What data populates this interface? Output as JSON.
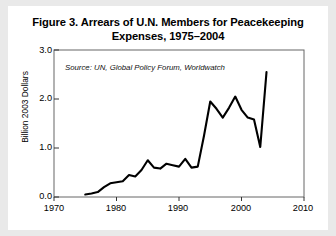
{
  "figure": {
    "title_line_1": "Figure 3. Arrears of U.N. Members for Peacekeeping",
    "title_line_2": "Expenses, 1975–2004",
    "source_note": "Source: UN, Global Policy Forum, Worldwatch",
    "background_color": "#e9e9e9",
    "card_color": "#ffffff",
    "line_color": "#000000",
    "axis_color": "#555555"
  },
  "chart_data": {
    "type": "line",
    "title": "Figure 3. Arrears of U.N. Members for Peacekeeping Expenses, 1975–2004",
    "xlabel": "",
    "ylabel": "Billion 2003 Dollars",
    "xlim": [
      1970,
      2010
    ],
    "ylim": [
      0.0,
      3.0
    ],
    "xticks": [
      1970,
      1980,
      1990,
      2000,
      2010
    ],
    "xtick_labels": [
      "1970",
      "1980",
      "1990",
      "2000",
      "2010"
    ],
    "yticks": [
      0.0,
      1.0,
      2.0,
      3.0
    ],
    "ytick_labels": [
      "0.0",
      "1.0",
      "2.0",
      "3.0"
    ],
    "grid": false,
    "legend": false,
    "annotations": [
      {
        "text": "Source: UN, Global Policy Forum, Worldwatch",
        "x": 1976,
        "y": 2.82,
        "style": "italic"
      }
    ],
    "series": [
      {
        "name": "Arrears of U.N. Members for Peacekeeping Expenses",
        "units": "Billion 2003 Dollars",
        "x": [
          1975,
          1976,
          1977,
          1978,
          1979,
          1980,
          1981,
          1982,
          1983,
          1984,
          1985,
          1986,
          1987,
          1988,
          1989,
          1990,
          1991,
          1992,
          1993,
          1994,
          1995,
          1996,
          1997,
          1998,
          1999,
          2000,
          2001,
          2002,
          2003,
          2004
        ],
        "values": [
          0.05,
          0.07,
          0.1,
          0.2,
          0.28,
          0.3,
          0.32,
          0.45,
          0.42,
          0.55,
          0.75,
          0.6,
          0.58,
          0.68,
          0.65,
          0.62,
          0.78,
          0.6,
          0.62,
          1.25,
          1.95,
          1.8,
          1.62,
          1.82,
          2.05,
          1.78,
          1.62,
          1.58,
          1.02,
          2.55
        ]
      }
    ]
  }
}
